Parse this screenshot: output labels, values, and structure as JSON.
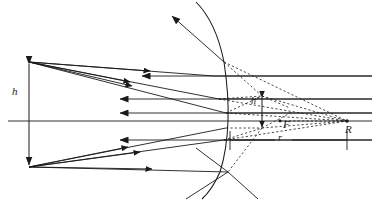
{
  "figure": {
    "type": "optics-ray-diagram",
    "width": 374,
    "height": 201,
    "background_color": "#ffffff",
    "stroke_color": "#1a1a1a"
  },
  "labels": {
    "object_height": "h",
    "image_height": "h′",
    "focal_point": "F",
    "center_of_curvature": "R",
    "radius": "r"
  },
  "geometry": {
    "optical_axis_y": 121,
    "mirror_vertex": {
      "x": 228,
      "y": 121
    },
    "object_top": {
      "x": 29,
      "y": 62
    },
    "object_bottom": {
      "x": 29,
      "y": 167
    },
    "focal_point": {
      "x": 280,
      "y": 121
    },
    "center_of_curvature": {
      "x": 347,
      "y": 121
    },
    "image_top": {
      "x": 262,
      "y": 96
    },
    "image_bottom": {
      "x": 262,
      "y": 128
    }
  },
  "elements": {
    "optical_axis": "horizontal-axis",
    "mirror": "concave-spherical-arc",
    "incident_rays": "parallel-rays-from-right",
    "reflected_rays": "converging-rays-to-object-points",
    "virtual_rays": "dashed-construction-lines",
    "object_marker": "double-headed-vertical-arrow",
    "image_marker": "double-headed-vertical-arrow",
    "radius_dimension": "dimension-line-with-end-ticks"
  }
}
